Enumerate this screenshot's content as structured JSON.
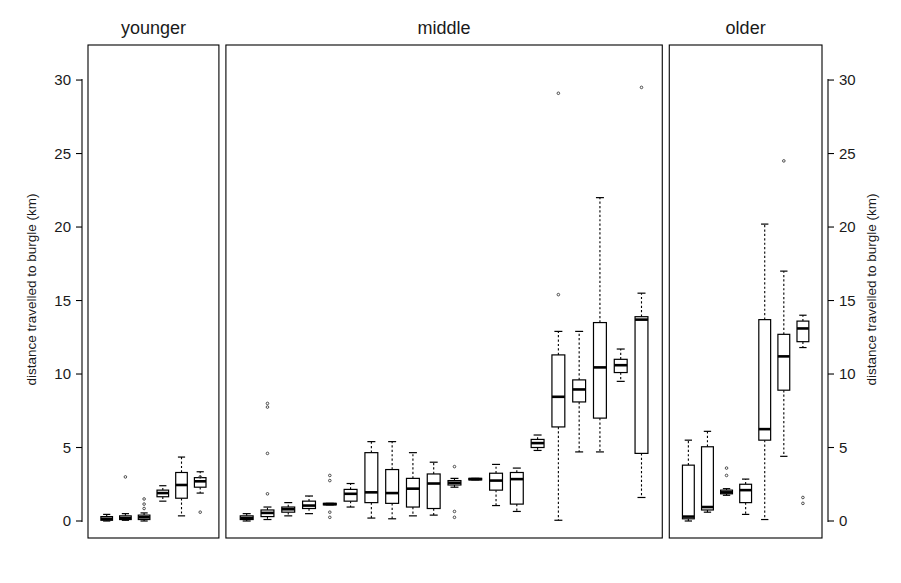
{
  "chart_data": {
    "type": "box",
    "title": "",
    "xlabel": "",
    "ylabel": "distance travelled to burgle (km)",
    "ylim": [
      0,
      31.5
    ],
    "yticks": [
      0,
      5,
      10,
      15,
      20,
      25,
      30
    ],
    "ytick_labels": [
      "0",
      "5",
      "10",
      "15",
      "20",
      "25",
      "30"
    ],
    "grid": false,
    "legend": "none",
    "left_axis_label": "distance travelled to burgle (km)",
    "right_axis_label": "distance travelled to burgle (km)",
    "panels": [
      {
        "name": "younger",
        "label": "younger",
        "boxes": [
          {
            "id": "y1",
            "low": 0.0,
            "q1": 0.05,
            "median": 0.15,
            "q3": 0.3,
            "high": 0.45,
            "outliers": []
          },
          {
            "id": "y2",
            "low": 0.05,
            "q1": 0.1,
            "median": 0.2,
            "q3": 0.35,
            "high": 0.5,
            "outliers": [
              3.0
            ]
          },
          {
            "id": "y3",
            "low": 0.0,
            "q1": 0.1,
            "median": 0.25,
            "q3": 0.4,
            "high": 0.55,
            "outliers": [
              1.5,
              1.15,
              0.85
            ]
          },
          {
            "id": "y4",
            "low": 1.35,
            "q1": 1.65,
            "median": 1.9,
            "q3": 2.1,
            "high": 2.4,
            "outliers": []
          },
          {
            "id": "y5",
            "low": 0.35,
            "q1": 1.55,
            "median": 2.45,
            "q3": 3.3,
            "high": 4.35,
            "outliers": []
          },
          {
            "id": "y6",
            "low": 1.9,
            "q1": 2.3,
            "median": 2.7,
            "q3": 2.95,
            "high": 3.35,
            "outliers": [
              0.6,
              3.0
            ]
          }
        ]
      },
      {
        "name": "middle",
        "label": "middle",
        "boxes": [
          {
            "id": "m1",
            "low": 0.0,
            "q1": 0.1,
            "median": 0.2,
            "q3": 0.35,
            "high": 0.5,
            "outliers": []
          },
          {
            "id": "m2",
            "low": 0.1,
            "q1": 0.3,
            "median": 0.55,
            "q3": 0.75,
            "high": 0.95,
            "outliers": [
              1.85,
              4.6,
              8.0,
              7.75
            ]
          },
          {
            "id": "m3",
            "low": 0.35,
            "q1": 0.6,
            "median": 0.8,
            "q3": 0.95,
            "high": 1.25,
            "outliers": []
          },
          {
            "id": "m4",
            "low": 0.5,
            "q1": 0.85,
            "median": 1.05,
            "q3": 1.35,
            "high": 1.7,
            "outliers": []
          },
          {
            "id": "m5",
            "low": 1.1,
            "q1": 1.1,
            "median": 1.15,
            "q3": 1.2,
            "high": 1.2,
            "outliers": [
              0.25,
              0.6,
              2.75,
              3.1
            ]
          },
          {
            "id": "m6",
            "low": 0.95,
            "q1": 1.35,
            "median": 1.85,
            "q3": 2.15,
            "high": 2.55,
            "outliers": []
          },
          {
            "id": "m7",
            "low": 0.2,
            "q1": 1.25,
            "median": 1.95,
            "q3": 4.65,
            "high": 5.4,
            "outliers": []
          },
          {
            "id": "m8",
            "low": 0.15,
            "q1": 1.2,
            "median": 1.9,
            "q3": 3.5,
            "high": 5.4,
            "outliers": []
          },
          {
            "id": "m9",
            "low": 0.35,
            "q1": 0.95,
            "median": 2.2,
            "q3": 2.9,
            "high": 4.65,
            "outliers": []
          },
          {
            "id": "m10",
            "low": 0.4,
            "q1": 0.85,
            "median": 2.55,
            "q3": 3.2,
            "high": 4.0,
            "outliers": []
          },
          {
            "id": "m11",
            "low": 2.3,
            "q1": 2.45,
            "median": 2.6,
            "q3": 2.75,
            "high": 2.9,
            "outliers": [
              0.25,
              0.65,
              3.7
            ]
          },
          {
            "id": "m12",
            "low": 2.8,
            "q1": 2.8,
            "median": 2.85,
            "q3": 2.9,
            "high": 2.9,
            "outliers": []
          },
          {
            "id": "m13",
            "low": 1.05,
            "q1": 2.1,
            "median": 2.75,
            "q3": 3.25,
            "high": 3.85,
            "outliers": []
          },
          {
            "id": "m14",
            "low": 0.65,
            "q1": 1.15,
            "median": 2.85,
            "q3": 3.3,
            "high": 3.6,
            "outliers": []
          },
          {
            "id": "m15",
            "low": 4.8,
            "q1": 5.0,
            "median": 5.3,
            "q3": 5.55,
            "high": 5.85,
            "outliers": []
          },
          {
            "id": "m16",
            "low": 0.05,
            "q1": 6.4,
            "median": 8.45,
            "q3": 11.3,
            "high": 12.9,
            "outliers": [
              15.4,
              29.1
            ]
          },
          {
            "id": "m17",
            "low": 4.7,
            "q1": 8.1,
            "median": 8.95,
            "q3": 9.6,
            "high": 12.9,
            "outliers": []
          },
          {
            "id": "m18",
            "low": 4.7,
            "q1": 7.0,
            "median": 10.45,
            "q3": 13.5,
            "high": 22.0,
            "outliers": []
          },
          {
            "id": "m19",
            "low": 9.5,
            "q1": 10.1,
            "median": 10.6,
            "q3": 11.0,
            "high": 11.7,
            "outliers": []
          },
          {
            "id": "m20",
            "low": 1.6,
            "q1": 4.6,
            "median": 13.7,
            "q3": 13.9,
            "high": 15.5,
            "outliers": [
              29.5
            ]
          }
        ]
      },
      {
        "name": "older",
        "label": "older",
        "boxes": [
          {
            "id": "o1",
            "low": 0.0,
            "q1": 0.15,
            "median": 0.3,
            "q3": 3.8,
            "high": 5.5,
            "outliers": []
          },
          {
            "id": "o2",
            "low": 0.6,
            "q1": 0.75,
            "median": 0.95,
            "q3": 5.05,
            "high": 6.1,
            "outliers": []
          },
          {
            "id": "o3",
            "low": 1.75,
            "q1": 1.85,
            "median": 1.95,
            "q3": 2.1,
            "high": 2.2,
            "outliers": [
              3.6,
              3.1
            ]
          },
          {
            "id": "o4",
            "low": 0.45,
            "q1": 1.25,
            "median": 2.1,
            "q3": 2.5,
            "high": 2.85,
            "outliers": []
          },
          {
            "id": "o5",
            "low": 0.1,
            "q1": 5.5,
            "median": 6.25,
            "q3": 13.7,
            "high": 20.2,
            "outliers": []
          },
          {
            "id": "o6",
            "low": 4.4,
            "q1": 8.9,
            "median": 11.2,
            "q3": 12.7,
            "high": 17.0,
            "outliers": [
              24.5
            ]
          },
          {
            "id": "o7",
            "low": 11.8,
            "q1": 12.2,
            "median": 13.1,
            "q3": 13.6,
            "high": 14.0,
            "outliers": [
              1.2,
              1.6
            ]
          }
        ]
      }
    ]
  },
  "panel_titles": {
    "younger": "younger",
    "middle": "middle",
    "older": "older"
  }
}
